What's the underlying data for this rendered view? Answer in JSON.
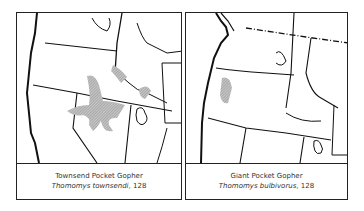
{
  "panels": [
    {
      "common_name": "Townsend Pocket Gopher",
      "scientific_name": "Thomomys townsendi",
      "page_ref": ", 128",
      "range_color": "#9a9a9a"
    },
    {
      "common_name": "Giant Pocket Gopher",
      "scientific_name": "Thomomys bulbivorus",
      "page_ref": ", 128",
      "range_color": "#9a9a9a"
    }
  ]
}
